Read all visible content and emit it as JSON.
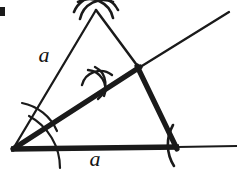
{
  "figure": {
    "canvas": {
      "width": 239,
      "height": 172,
      "background": "#ffffff"
    },
    "ink_color": "#1a1a1a",
    "labels": [
      {
        "name": "side-label-left",
        "text": "a",
        "x": 44,
        "y": 62,
        "font_size": 22
      },
      {
        "name": "side-label-base",
        "text": "a",
        "x": 95,
        "y": 166,
        "font_size": 22
      }
    ],
    "points": {
      "left_vertex": {
        "x": 13,
        "y": 149
      },
      "apex": {
        "x": 96,
        "y": 9
      },
      "right_vertex": {
        "x": 177,
        "y": 147
      },
      "bisector_intersection": {
        "x": 139,
        "y": 68
      },
      "ray_end": {
        "x": 229,
        "y": 12
      },
      "base_end": {
        "x": 236,
        "y": 146
      },
      "cross_mark_center": {
        "x": 97,
        "y": 83
      }
    },
    "strokes": {
      "thin": 2.0,
      "thick": 5.0,
      "arc": 2.0,
      "tick": 2.6
    },
    "corner_artifact": {
      "name": "corner-speck",
      "x": 0,
      "y": 7,
      "width": 5,
      "height": 9
    }
  }
}
